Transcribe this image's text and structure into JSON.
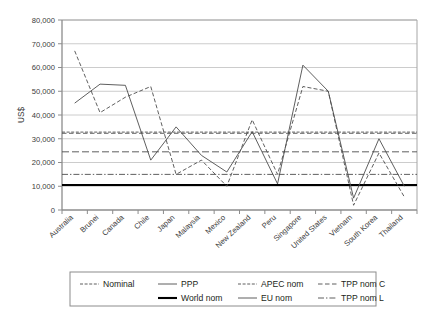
{
  "chart_data": {
    "type": "line",
    "title": "",
    "xlabel": "",
    "ylabel": "US$",
    "ylim": [
      0,
      80000
    ],
    "ytick_step": 10000,
    "ytick_labels": [
      "0",
      "10,000",
      "20,000",
      "30,000",
      "40,000",
      "50,000",
      "60,000",
      "70,000",
      "80,000"
    ],
    "grid": true,
    "legend_position": "below-plot",
    "categories": [
      "Australia",
      "Brunei",
      "Canada",
      "Chile",
      "Japan",
      "Malaysia",
      "Mexico",
      "New Zealand",
      "Peru",
      "Singapore",
      "United States",
      "Vietnam",
      "South Korea",
      "Thailand"
    ],
    "series": [
      {
        "name": "Nominal",
        "style": "dashed",
        "values": [
          67000,
          41000,
          47500,
          52000,
          15000,
          21000,
          10000,
          38000,
          15000,
          52000,
          50000,
          2000,
          24000,
          5500
        ]
      },
      {
        "name": "PPP",
        "style": "solid",
        "values": [
          45000,
          53000,
          52500,
          21000,
          35000,
          23000,
          16000,
          33000,
          11000,
          61000,
          50000,
          5000,
          30000,
          10000
        ]
      }
    ],
    "reference_lines": [
      {
        "name": "APEC nom",
        "value": 32800,
        "style": "fine-dashed"
      },
      {
        "name": "TPP nom C",
        "value": 32300,
        "style": "dashed-wide"
      },
      {
        "name": "EU nom",
        "value": 24500,
        "style": "dash-long"
      },
      {
        "name": "TPP nom L",
        "value": 15000,
        "style": "dash-dot"
      },
      {
        "name": "World nom",
        "value": 10500,
        "style": "solid-thick"
      }
    ]
  },
  "legend": {
    "rows": [
      [
        {
          "label": "Nominal",
          "style": "fine-dashed"
        },
        {
          "label": "PPP",
          "style": "solid-thin"
        },
        {
          "label": "APEC nom",
          "style": "fine-dashed"
        },
        {
          "label": "TPP nom C",
          "style": "dashed-wide"
        }
      ],
      [
        {
          "label": "",
          "style": "none"
        },
        {
          "label": "World nom",
          "style": "solid-thick"
        },
        {
          "label": "EU nom",
          "style": "solid-thin"
        },
        {
          "label": "TPP nom L",
          "style": "dash-dot"
        }
      ]
    ]
  },
  "colors": {
    "axis": "#808080",
    "grid": "#bfbfbf",
    "series": "#4d4d4d",
    "bold": "#000000",
    "text": "#231f20",
    "legend_border": "#808080"
  }
}
